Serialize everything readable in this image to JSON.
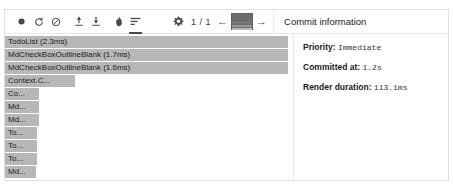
{
  "toolbar": {
    "buttons": [
      {
        "name": "record-button",
        "icon": "record-icon",
        "label": "Start profiling",
        "active": false
      },
      {
        "name": "reload-button",
        "icon": "reload-icon",
        "label": "Reload and start profiling",
        "active": false
      },
      {
        "name": "clear-button",
        "icon": "clear-icon",
        "label": "Clear profiling data",
        "active": false
      },
      {
        "name": "load-profile-button",
        "icon": "upload-icon",
        "label": "Load profile",
        "active": false
      },
      {
        "name": "save-profile-button",
        "icon": "download-icon",
        "label": "Save profile",
        "active": false
      },
      {
        "name": "flamegraph-tab",
        "icon": "flame-icon",
        "label": "Flamegraph",
        "active": false
      },
      {
        "name": "ranked-tab",
        "icon": "ranked-chart-icon",
        "label": "Ranked",
        "active": true
      },
      {
        "name": "settings-button",
        "icon": "gear-icon",
        "label": "Settings",
        "active": false
      }
    ],
    "page_counter": "1 / 1",
    "prev_label": "←",
    "next_label": "→",
    "snapshot_label": "commit-snapshot"
  },
  "detail_panel": {
    "title": "Commit information",
    "rows": [
      {
        "label": "Priority:",
        "value": "Immediate"
      },
      {
        "label": "Committed at:",
        "value": "1.2s"
      },
      {
        "label": "Render duration:",
        "value": "113.1ms"
      }
    ]
  },
  "chart_data": {
    "type": "bar",
    "xlabel": "",
    "ylabel": "",
    "categories": [
      "TodoList (2.3ms)",
      "MdCheckBoxOutlineBlank (1.7ms)",
      "MdCheckBoxOutlineBlank (1.6ms)",
      "Context.C...",
      "Co...",
      "Md...",
      "Md...",
      "To...",
      "To...",
      "To...",
      "Md..."
    ],
    "values": [
      2.3,
      1.7,
      1.6,
      0.62,
      0.3,
      0.3,
      0.3,
      0.28,
      0.28,
      0.28,
      0.27
    ],
    "widths_px": [
      283,
      283,
      283,
      70,
      34,
      34,
      34,
      32,
      32,
      32,
      31
    ],
    "bar_color": "#b7b7b7",
    "grid": false,
    "legend": "none"
  }
}
